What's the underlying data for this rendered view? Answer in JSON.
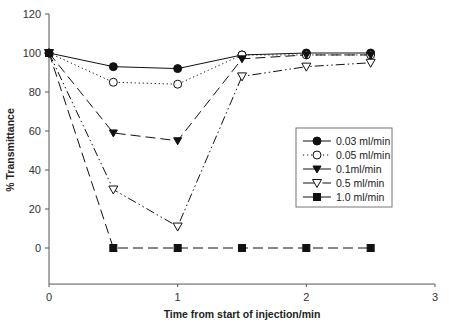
{
  "chart_data": {
    "type": "line",
    "title": "",
    "xlabel": "Time from start of injection/min",
    "ylabel": "% Transmittance",
    "xlim": [
      0,
      3
    ],
    "ylim": [
      -18.5,
      120
    ],
    "xticks": [
      0,
      1,
      2,
      3
    ],
    "yticks": [
      0,
      20,
      40,
      60,
      80,
      100,
      120
    ],
    "grid": false,
    "legend_position": "center-right",
    "series": [
      {
        "name": "0.03 ml/min",
        "marker": "filled-circle",
        "line": "solid",
        "x": [
          0,
          0.5,
          1,
          1.5,
          2,
          2.5
        ],
        "y": [
          100,
          93,
          92,
          99,
          100,
          100
        ]
      },
      {
        "name": "0.05 ml/min",
        "marker": "open-circle",
        "line": "dotted",
        "x": [
          0,
          0.5,
          1,
          1.5,
          2,
          2.5
        ],
        "y": [
          100,
          85,
          84,
          99,
          99,
          99
        ]
      },
      {
        "name": "0.1ml/min",
        "marker": "filled-triangle-down",
        "line": "long-dash",
        "x": [
          0,
          0.5,
          1,
          1.5,
          2,
          2.5
        ],
        "y": [
          100,
          59,
          55,
          97,
          99,
          99
        ]
      },
      {
        "name": "0.5 ml/min",
        "marker": "open-triangle-down",
        "line": "dash-dot-dot",
        "x": [
          0,
          0.5,
          1,
          1.5,
          2,
          2.5
        ],
        "y": [
          100,
          30,
          11,
          88,
          93,
          95
        ]
      },
      {
        "name": "1.0 ml/min",
        "marker": "filled-square",
        "line": "long-dash",
        "x": [
          0,
          0.5,
          1,
          1.5,
          2,
          2.5
        ],
        "y": [
          100,
          0,
          0,
          0,
          0,
          0
        ]
      }
    ]
  }
}
